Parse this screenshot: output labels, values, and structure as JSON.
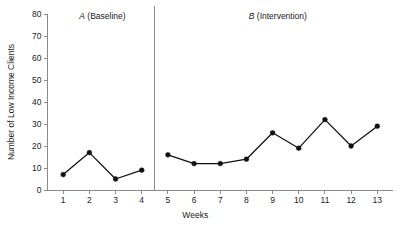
{
  "chart_data": {
    "type": "line",
    "title": "",
    "subtitle": "",
    "xlabel": "Weeks",
    "ylabel": "Number of Low Income Clients",
    "x": [
      1,
      2,
      3,
      4,
      5,
      6,
      7,
      8,
      9,
      10,
      11,
      12,
      13
    ],
    "xlim": [
      0.4,
      13.6
    ],
    "ylim": [
      0,
      80
    ],
    "xticks": [
      1,
      2,
      3,
      4,
      5,
      6,
      7,
      8,
      9,
      10,
      11,
      12,
      13
    ],
    "xtick_labels": [
      "1",
      "2",
      "3",
      "4",
      "5",
      "6",
      "7",
      "8",
      "9",
      "10",
      "11",
      "12",
      "13"
    ],
    "yticks": [
      0,
      10,
      20,
      30,
      40,
      50,
      60,
      70,
      80
    ],
    "ytick_labels": [
      "0",
      "10",
      "20",
      "30",
      "40",
      "50",
      "60",
      "70",
      "80"
    ],
    "grid": false,
    "legend": false,
    "legend_position": "none",
    "marker": "filled-circle",
    "line_color": "#111111",
    "marker_color": "#111111",
    "axis_color": "#8a8a8a",
    "series": [
      {
        "name": "A (Baseline)",
        "phase": "A",
        "x": [
          1,
          2,
          3,
          4
        ],
        "values": [
          7,
          17,
          5,
          9
        ]
      },
      {
        "name": "B (Intervention)",
        "phase": "B",
        "x": [
          5,
          6,
          7,
          8,
          9,
          10,
          11,
          12,
          13
        ],
        "values": [
          16,
          12,
          12,
          14,
          26,
          19,
          32,
          20,
          29
        ]
      }
    ],
    "annotations": [
      {
        "name": "phase-divider",
        "type": "vline",
        "x": 4.5,
        "color": "#8a8a8a"
      }
    ],
    "phase_labels": [
      {
        "letter": "A",
        "description": " (Baseline)",
        "full": "A (Baseline)",
        "x_center": 2.5
      },
      {
        "letter": "B",
        "description": " (Intervention)",
        "full": "B (Intervention)",
        "x_center": 9.2
      }
    ]
  }
}
